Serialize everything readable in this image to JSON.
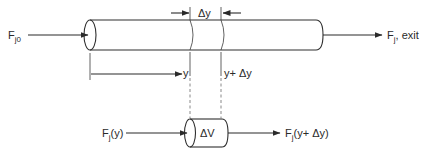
{
  "diagram": {
    "type": "plug-flow-reactor-mole-balance",
    "labels": {
      "inlet_flow": {
        "main": "F",
        "sub": "j0"
      },
      "exit_flow": {
        "main": "F",
        "sub": "j",
        "suffix": ", exit"
      },
      "delta_y": "Δy",
      "position_y": "y",
      "position_y_plus": "y+ Δy",
      "element_volume": "ΔV",
      "flow_in_element": {
        "main": "F",
        "sub": "j",
        "suffix": "(y)"
      },
      "flow_out_element": {
        "main": "F",
        "sub": "j",
        "suffix": "(y+ Δy)"
      }
    },
    "components": [
      "main-reactor-tube",
      "differential-volume-element",
      "inlet-arrow",
      "exit-arrow",
      "position-arrow",
      "delta-y-dimension-arrows",
      "dashed-projection-lines"
    ]
  }
}
